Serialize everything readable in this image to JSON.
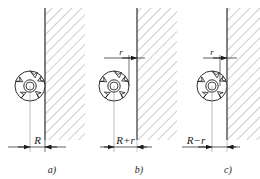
{
  "figure": {
    "type": "engineering-diagram",
    "background": "#ffffff",
    "line_color": "#1a1a1a",
    "hatch_color": "#6e6e6e",
    "panels": [
      {
        "id": "a",
        "label": "a)",
        "dimension_label": "R",
        "small_dimension_label": null,
        "wall_x": 45,
        "cutter_cx": 30,
        "cutter_cy": 86,
        "cutter_r": 15,
        "dim_left_x": 15,
        "dim_right_x": 45,
        "case": "tangent",
        "offset_r": 0
      },
      {
        "id": "b",
        "label": "b)",
        "dimension_label": "R+r",
        "small_dimension_label": "r",
        "wall_x": 137,
        "cutter_cx": 114,
        "cutter_cy": 86,
        "cutter_r": 15,
        "dim_left_x": 107,
        "dim_right_x": 137,
        "case": "clear-by-r",
        "offset_r": 8
      },
      {
        "id": "c",
        "label": "c)",
        "dimension_label": "R−r",
        "small_dimension_label": "r",
        "wall_x": 227,
        "cutter_cx": 212,
        "cutter_cy": 86,
        "cutter_r": 15,
        "dim_left_x": 190,
        "dim_right_x": 220,
        "case": "overlap-by-r",
        "offset_r": 8
      }
    ],
    "cutter": {
      "name": "milling-cutter",
      "teeth": 5,
      "hub_radius": 6,
      "bore_radius": 4
    }
  }
}
